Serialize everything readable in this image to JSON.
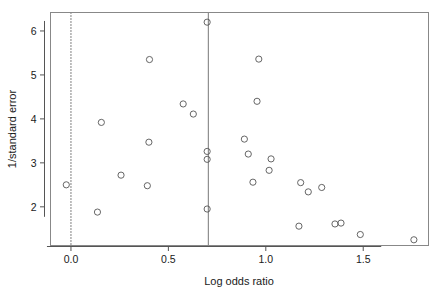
{
  "chart_data": {
    "type": "scatter",
    "title": "",
    "xlabel": "Log odds ratio",
    "ylabel": "1/standard error",
    "xlim": [
      -0.105,
      1.835
    ],
    "ylim": [
      1.12,
      6.42
    ],
    "xticks": [
      0.0,
      0.5,
      1.0,
      1.5
    ],
    "xticklabels": [
      "0.0",
      "0.5",
      "1.0",
      "1.5"
    ],
    "yticks": [
      2,
      3,
      4,
      5,
      6
    ],
    "yticklabels": [
      "2",
      "3",
      "4",
      "5",
      "6"
    ],
    "grid": false,
    "legend": null,
    "marker": "open-circle",
    "marker_color": "#555555",
    "frame_color": "#888888",
    "reference_lines": [
      {
        "name": "null-effect-line",
        "orientation": "vertical",
        "x": 0.0,
        "style": "dotted",
        "color": "#000000"
      },
      {
        "name": "pooled-effect-line",
        "orientation": "vertical",
        "x": 0.705,
        "style": "solid",
        "color": "#777777"
      }
    ],
    "points": [
      {
        "x": -0.024,
        "y": 2.5
      },
      {
        "x": 0.156,
        "y": 3.92
      },
      {
        "x": 0.136,
        "y": 1.88
      },
      {
        "x": 0.257,
        "y": 2.72
      },
      {
        "x": 0.403,
        "y": 5.35
      },
      {
        "x": 0.4,
        "y": 3.47
      },
      {
        "x": 0.392,
        "y": 2.48
      },
      {
        "x": 0.576,
        "y": 4.34
      },
      {
        "x": 0.628,
        "y": 4.11
      },
      {
        "x": 0.699,
        "y": 6.2
      },
      {
        "x": 0.699,
        "y": 3.26
      },
      {
        "x": 0.699,
        "y": 3.08
      },
      {
        "x": 0.699,
        "y": 1.95
      },
      {
        "x": 0.89,
        "y": 3.54
      },
      {
        "x": 0.91,
        "y": 3.2
      },
      {
        "x": 0.934,
        "y": 2.56
      },
      {
        "x": 0.964,
        "y": 5.36
      },
      {
        "x": 0.955,
        "y": 4.4
      },
      {
        "x": 1.027,
        "y": 3.09
      },
      {
        "x": 1.017,
        "y": 2.83
      },
      {
        "x": 1.179,
        "y": 2.55
      },
      {
        "x": 1.218,
        "y": 2.34
      },
      {
        "x": 1.287,
        "y": 2.44
      },
      {
        "x": 1.17,
        "y": 1.56
      },
      {
        "x": 1.355,
        "y": 1.61
      },
      {
        "x": 1.386,
        "y": 1.63
      },
      {
        "x": 1.485,
        "y": 1.37
      },
      {
        "x": 1.76,
        "y": 1.25
      }
    ]
  }
}
